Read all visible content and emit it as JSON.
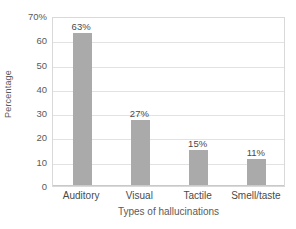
{
  "chart_data": {
    "type": "bar",
    "title": "",
    "xlabel": "Types of hallucinations",
    "ylabel": "Percentage",
    "categories": [
      "Auditory",
      "Visual",
      "Tactile",
      "Smell/taste"
    ],
    "values": [
      63,
      27,
      15,
      11
    ],
    "data_labels": [
      "63%",
      "27%",
      "15%",
      "11%"
    ],
    "ylim": [
      0,
      70
    ],
    "ytick_values": [
      0,
      10,
      20,
      30,
      40,
      50,
      60,
      70
    ],
    "ytick_labels": [
      "0",
      "10",
      "20",
      "30",
      "40",
      "50",
      "60",
      "70%"
    ],
    "grid": "horizontal",
    "legend": "none",
    "bar_color": "#aaaaaa",
    "gridline_color": "#e2e2e2",
    "frame_color": "#d9d9d9",
    "text_color": "#4a4a4a"
  }
}
